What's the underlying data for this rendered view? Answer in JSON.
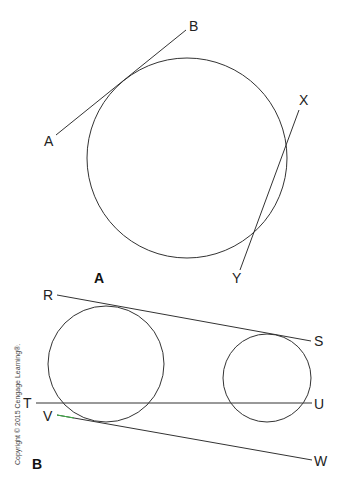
{
  "figure": {
    "panel_a": {
      "label": "A",
      "points": {
        "A": "A",
        "B": "B",
        "X": "X",
        "Y": "Y"
      },
      "description": "Circle with line AB tangent and line XY secant"
    },
    "panel_b": {
      "label": "B",
      "points": {
        "R": "R",
        "S": "S",
        "T": "T",
        "U": "U",
        "V": "V",
        "W": "W"
      },
      "description": "Two circles with lines RS, TU, VW"
    },
    "copyright": "Copyright © 2015 Cengage Learning®.",
    "colors": {
      "stroke": "#333333",
      "accent_green": "#3cb043"
    }
  }
}
